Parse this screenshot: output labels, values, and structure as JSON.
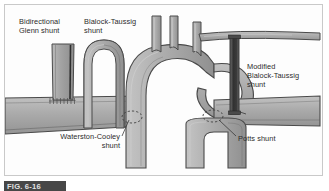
{
  "figure": {
    "caption_id": "FIG. 6-16",
    "frame_border_color": "#c9c9c9",
    "background_color": "#fdfdfd"
  },
  "colors": {
    "vessel_fill": "#a9a9a9",
    "vessel_fill_light": "#c2c2c2",
    "vessel_fill_dark": "#8f8f8f",
    "vessel_outline": "#4a4a4a",
    "graft_dark": "#3b3b3b",
    "label_text": "#2b2b2b",
    "leader_line": "#3a3a3a",
    "caption_bar": "#474747"
  },
  "labels": {
    "bidirectional_glenn": "Bidirectional\nGlenn shunt",
    "blalock_taussig": "Blalock-Taussig\nshunt",
    "modified_blalock_taussig": "Modified\nBlalock-Taussig\nshunt",
    "waterston_cooley": "Waterston-Cooley\nshunt",
    "potts": "Potts shunt"
  },
  "structures": [
    {
      "name": "aortic-arch",
      "description": "Aortic arch with ascending and descending segments"
    },
    {
      "name": "brachiocephalic-trunk",
      "description": "Brachiocephalic artery branch"
    },
    {
      "name": "left-common-carotid-artery",
      "description": "Left common carotid branch"
    },
    {
      "name": "left-subclavian-artery",
      "description": "Left subclavian branch"
    },
    {
      "name": "main-pulmonary-artery",
      "description": "Main pulmonary artery trunk"
    },
    {
      "name": "right-pulmonary-artery",
      "description": "Right pulmonary artery"
    },
    {
      "name": "left-pulmonary-artery",
      "description": "Left pulmonary artery"
    },
    {
      "name": "superior-vena-cava",
      "description": "Superior vena cava segment"
    }
  ],
  "shunts": [
    {
      "name": "bidirectional-glenn-shunt",
      "type": "vessel-anastomosis",
      "marker": "suture-line"
    },
    {
      "name": "blalock-taussig-shunt",
      "type": "arterial-turndown",
      "marker": "curved-conduit"
    },
    {
      "name": "modified-blalock-taussig-shunt",
      "type": "synthetic-graft",
      "marker": "dark-tube-graft"
    },
    {
      "name": "waterston-cooley-shunt",
      "type": "side-to-side-anastomosis",
      "marker": "dashed-ellipse"
    },
    {
      "name": "potts-shunt",
      "type": "side-to-side-anastomosis",
      "marker": "dashed-ellipse"
    }
  ]
}
